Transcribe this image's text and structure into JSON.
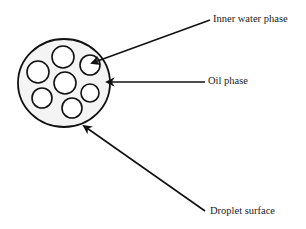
{
  "diagram": {
    "type": "double emulsion droplet schematic",
    "colors": {
      "stroke": "#111111",
      "droplet_fill": "#f4f4f4",
      "inner_fill": "#ffffff",
      "text": "#222222"
    },
    "droplet": {
      "cx": 64,
      "cy": 83,
      "rx": 46,
      "ry": 44
    },
    "inner_droplets": [
      {
        "cx": 63,
        "cy": 57,
        "r": 11
      },
      {
        "cx": 38,
        "cy": 72,
        "r": 11
      },
      {
        "cx": 90,
        "cy": 65,
        "r": 10
      },
      {
        "cx": 65,
        "cy": 83,
        "r": 11
      },
      {
        "cx": 90,
        "cy": 93,
        "r": 9
      },
      {
        "cx": 42,
        "cy": 98,
        "r": 10
      },
      {
        "cx": 72,
        "cy": 108,
        "r": 10
      }
    ],
    "labels": [
      {
        "id": "inner-water-phase",
        "text": "Inner water phase",
        "x": 213,
        "y": 14,
        "arrow": {
          "x1": 210,
          "y1": 20,
          "x2": 92,
          "y2": 63
        }
      },
      {
        "id": "oil-phase",
        "text": "Oil phase",
        "x": 208,
        "y": 76,
        "arrow": {
          "x1": 205,
          "y1": 82,
          "x2": 107,
          "y2": 82
        }
      },
      {
        "id": "droplet-surface",
        "text": "Droplet surface",
        "x": 210,
        "y": 206,
        "arrow": {
          "x1": 205,
          "y1": 211,
          "x2": 84,
          "y2": 126
        }
      }
    ]
  }
}
